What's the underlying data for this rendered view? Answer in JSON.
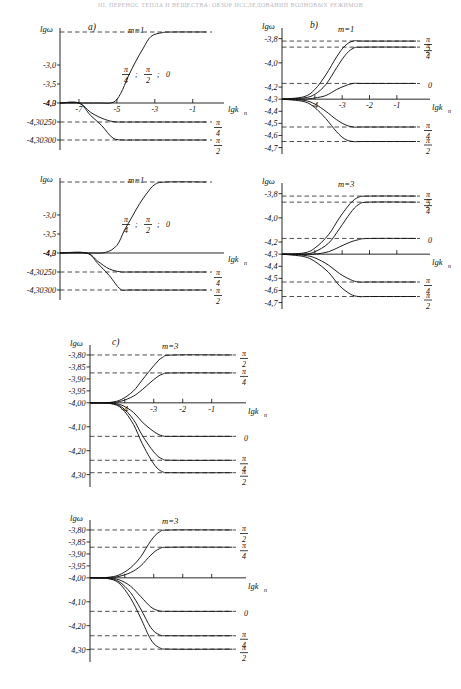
{
  "header": {
    "running_title": "III. ПЕРЕНОС ТЕПЛА И ВЕЩЕСТВА: ОБЗОР ИССЛЕДОВАНИЙ ВОЛНОВЫХ РЕЖИМОВ",
    "page_number": "2"
  },
  "axis_titles": {
    "y": "lgω",
    "x": "lgk",
    "x_sub": "n"
  },
  "symbols": {
    "pi": "π",
    "two": "2",
    "four": "4",
    "zero": "0",
    "semicolon": ";"
  },
  "panels": [
    {
      "id": "a-top",
      "label": "a)",
      "m_label": "m=1",
      "inline_annotation": [
        "π",
        "4",
        ";",
        "π",
        "2",
        ";",
        "0"
      ],
      "y_ticks": [
        "-3,0",
        "-3,5",
        "-4,0",
        "-4,3",
        "-4,30250",
        "-4,30300"
      ],
      "x_ticks": [
        "-7",
        "-5",
        "-3",
        "-1"
      ],
      "x_axis_label": "lgk",
      "x_axis_sub": "n",
      "right_labels": [
        {
          "num": "π",
          "den": "4"
        },
        {
          "num": "π",
          "den": "2"
        }
      ]
    },
    {
      "id": "a-bottom",
      "label": "",
      "m_label": "m=1",
      "inline_annotation": [
        "π",
        "4",
        ";",
        "π",
        "2",
        ";",
        "0"
      ],
      "y_ticks": [
        "-3,0",
        "-3,5",
        "-4,0",
        "-4,3",
        "-4,30250",
        "-4,30300"
      ],
      "x_ticks": [],
      "x_axis_label": "lgk",
      "x_axis_sub": "n",
      "right_labels": [
        {
          "num": "π",
          "den": "4"
        },
        {
          "num": "π",
          "den": "2"
        }
      ]
    },
    {
      "id": "b-top",
      "label": "b)",
      "m_label": "m=1",
      "y_ticks": [
        "-3,8",
        "-4,0",
        "-4,2",
        "-4,3",
        "-4,4",
        "-4,5",
        "-4,6",
        "-4,7"
      ],
      "x_ticks": [
        "-4",
        "-3",
        "-2",
        "-1"
      ],
      "x_axis_label": "lgk",
      "x_axis_sub": "n",
      "right_labels": [
        {
          "num": "π",
          "den": "2"
        },
        {
          "num": "π",
          "den": "4"
        },
        {
          "num": "0",
          "den": ""
        },
        {
          "num": "π",
          "den": "4"
        },
        {
          "num": "π",
          "den": "2"
        }
      ]
    },
    {
      "id": "b-bottom",
      "label": "",
      "m_label": "m=3",
      "y_ticks": [
        "-3,8",
        "-4,0",
        "-4,2",
        "-4,3",
        "-4,4",
        "-4,5",
        "-4,6",
        "-4,7"
      ],
      "x_ticks": [],
      "x_axis_label": "lgk",
      "x_axis_sub": "n",
      "right_labels": [
        {
          "num": "π",
          "den": "2"
        },
        {
          "num": "π",
          "den": "4"
        },
        {
          "num": "0",
          "den": ""
        },
        {
          "num": "π",
          "den": "4"
        },
        {
          "num": "π",
          "den": "2"
        }
      ]
    },
    {
      "id": "c-top",
      "label": "c)",
      "m_label": "m=3",
      "y_ticks": [
        "-3,80",
        "-3,85",
        "-3,90",
        "-3,95",
        "-4,00",
        "-4,10",
        "-4,20",
        "4,30"
      ],
      "x_ticks": [
        "-4",
        "-3",
        "-2",
        "-1"
      ],
      "x_axis_label": "lgk",
      "x_axis_sub": "n",
      "right_labels": [
        {
          "num": "π",
          "den": "2"
        },
        {
          "num": "π",
          "den": "4"
        },
        {
          "num": "0",
          "den": ""
        },
        {
          "num": "π",
          "den": "4"
        },
        {
          "num": "π",
          "den": "2"
        }
      ]
    },
    {
      "id": "c-bottom",
      "label": "",
      "m_label": "m=3",
      "y_ticks": [
        "-3,80",
        "-3,85",
        "-3,90",
        "-3,95",
        "-4,00",
        "-4,10",
        "-4,20",
        "4,30"
      ],
      "x_ticks": [],
      "x_axis_label": "lgk",
      "x_axis_sub": "n",
      "right_labels": [
        {
          "num": "π",
          "den": "2"
        },
        {
          "num": "π",
          "den": "4"
        },
        {
          "num": "0",
          "den": ""
        },
        {
          "num": "π",
          "den": "4"
        },
        {
          "num": "π",
          "den": "2"
        }
      ]
    }
  ],
  "chart_data": [
    {
      "id": "a-top",
      "type": "line",
      "title": "a)  m=1",
      "xlabel": "lgk_n",
      "ylabel": "lgω",
      "xlim": [
        -8.0,
        -0.3
      ],
      "xticks": [
        -7,
        -5,
        -3,
        -1
      ],
      "ylabel_ticks": [
        "-3,0",
        "-3,5",
        "-4,0",
        "-4,3",
        "-4,30250",
        "-4,30300"
      ],
      "grid": false,
      "notes": "Upper branch is a sigmoid rising from the -4,3 baseline to a plateau above -3,0; lower two branches break away at lgk_n = -7 and settle on -4,30250 and -4,30300.",
      "series": [
        {
          "name": "π/4 ; π/2 ; 0 (upper sigmoid)",
          "x": [
            -8.0,
            -7.0,
            -6.0,
            -5.2,
            -4.8,
            -4.4,
            -4.0,
            -3.6,
            -3.2,
            -2.6,
            -2.0,
            -0.3
          ],
          "y": [
            -4.3,
            -4.3,
            -4.3,
            -4.29,
            -4.15,
            -3.8,
            -3.4,
            -3.05,
            -2.85,
            -2.79,
            -2.78,
            -2.78
          ]
        },
        {
          "name": "π/4 (lower)",
          "x": [
            -8.0,
            -7.0,
            -6.4,
            -5.8,
            -5.2,
            -4.6,
            -4.0,
            -0.3
          ],
          "y": [
            -4.3,
            -4.3,
            -4.3012,
            -4.302,
            -4.30245,
            -4.3025,
            -4.3025,
            -4.3025
          ]
        },
        {
          "name": "π/2 (lower)",
          "x": [
            -8.0,
            -7.0,
            -6.4,
            -5.8,
            -5.2,
            -4.6,
            -4.0,
            -0.3
          ],
          "y": [
            -4.3,
            -4.3,
            -4.3016,
            -4.3026,
            -4.30295,
            -4.303,
            -4.303,
            -4.303
          ]
        }
      ],
      "hlines": [
        -2.78,
        -4.3025,
        -4.303
      ]
    },
    {
      "id": "a-bottom",
      "type": "line",
      "title": "m=1",
      "xlabel": "lgk_n",
      "ylabel": "lgω",
      "xlim": [
        -8.0,
        -0.3
      ],
      "xticks": [],
      "ylabel_ticks": [
        "-3,0",
        "-3,5",
        "-4,0",
        "-4,3",
        "-4,30250",
        "-4,30300"
      ],
      "grid": false,
      "notes": "Same family as a-top, shifted right: sigmoid onset near lgk_n = -5.",
      "series": [
        {
          "name": "π/4 ; π/2 ; 0 (upper sigmoid)",
          "x": [
            -8.0,
            -6.5,
            -5.6,
            -5.0,
            -4.6,
            -4.2,
            -3.8,
            -3.4,
            -3.0,
            -2.4,
            -0.3
          ],
          "y": [
            -4.3,
            -4.3,
            -4.29,
            -4.18,
            -3.9,
            -3.55,
            -3.2,
            -2.95,
            -2.82,
            -2.78,
            -2.78
          ]
        },
        {
          "name": "π/4 (lower)",
          "x": [
            -8.0,
            -6.6,
            -6.0,
            -5.4,
            -4.8,
            -4.2,
            -0.3
          ],
          "y": [
            -4.3,
            -4.3,
            -4.3011,
            -4.3021,
            -4.30248,
            -4.3025,
            -4.3025
          ]
        },
        {
          "name": "π/2 (lower)",
          "x": [
            -8.0,
            -6.6,
            -6.0,
            -5.4,
            -4.8,
            -4.2,
            -0.3
          ],
          "y": [
            -4.3,
            -4.3,
            -4.3014,
            -4.3026,
            -4.30298,
            -4.303,
            -4.303
          ]
        }
      ],
      "hlines": [
        -2.78,
        -4.3025,
        -4.303
      ]
    },
    {
      "id": "b-top",
      "type": "line",
      "title": "b)  m=1",
      "xlabel": "lgk_n",
      "ylabel": "lgω",
      "xlim": [
        -5.2,
        -0.3
      ],
      "xticks": [
        -4,
        -3,
        -2,
        -1
      ],
      "ylim": [
        -4.7,
        -3.75
      ],
      "ylabel_ticks": [
        "-3,8",
        "-4,0",
        "-4,2",
        "-4,3",
        "-4,4",
        "-4,5",
        "-4,6",
        "-4,7"
      ],
      "grid": false,
      "notes": "Five branches fan out from the common point lgω = -4,3. Upper plateaus: -3,82 (π/2), -3,87 (π/4), -4,17 (0). Lower plateaus: -4,53 (π/4), -4,65 (π/2).",
      "series": [
        {
          "name": "π/2 (up)",
          "x": [
            -5.2,
            -4.4,
            -4.0,
            -3.6,
            -3.2,
            -2.9,
            -2.6,
            -2.2,
            -0.3
          ],
          "y": [
            -4.3,
            -4.28,
            -4.22,
            -4.1,
            -3.95,
            -3.86,
            -3.82,
            -3.82,
            -3.82
          ]
        },
        {
          "name": "π/4 (up)",
          "x": [
            -5.2,
            -4.4,
            -4.0,
            -3.6,
            -3.2,
            -2.9,
            -2.6,
            -2.2,
            -0.3
          ],
          "y": [
            -4.3,
            -4.29,
            -4.26,
            -4.18,
            -4.04,
            -3.94,
            -3.88,
            -3.87,
            -3.87
          ]
        },
        {
          "name": "0",
          "x": [
            -5.2,
            -4.4,
            -4.0,
            -3.6,
            -3.2,
            -2.9,
            -2.6,
            -2.2,
            -0.3
          ],
          "y": [
            -4.3,
            -4.3,
            -4.29,
            -4.27,
            -4.22,
            -4.19,
            -4.17,
            -4.17,
            -4.17
          ]
        },
        {
          "name": "π/4 (down)",
          "x": [
            -5.2,
            -4.4,
            -4.0,
            -3.6,
            -3.2,
            -2.9,
            -2.6,
            -2.2,
            -0.3
          ],
          "y": [
            -4.3,
            -4.31,
            -4.34,
            -4.4,
            -4.47,
            -4.51,
            -4.53,
            -4.53,
            -4.53
          ]
        },
        {
          "name": "π/2 (down)",
          "x": [
            -5.2,
            -4.4,
            -4.0,
            -3.6,
            -3.2,
            -2.9,
            -2.6,
            -2.2,
            -0.3
          ],
          "y": [
            -4.3,
            -4.32,
            -4.37,
            -4.46,
            -4.57,
            -4.63,
            -4.65,
            -4.65,
            -4.65
          ]
        }
      ],
      "hlines": [
        -3.82,
        -3.87,
        -4.17,
        -4.53,
        -4.65
      ]
    },
    {
      "id": "b-bottom",
      "type": "line",
      "title": "m=3",
      "xlabel": "lgk_n",
      "ylabel": "lgω",
      "xlim": [
        -5.2,
        -0.3
      ],
      "xticks": [],
      "ylim": [
        -4.7,
        -3.75
      ],
      "ylabel_ticks": [
        "-3,8",
        "-4,0",
        "-4,2",
        "-4,3",
        "-4,4",
        "-4,5",
        "-4,6",
        "-4,7"
      ],
      "grid": false,
      "notes": "Same five-branch fan for m=3, transitions shifted slightly right relative to b-top.",
      "series": [
        {
          "name": "π/2 (up)",
          "x": [
            -5.2,
            -4.4,
            -4.0,
            -3.5,
            -3.1,
            -2.7,
            -2.4,
            -2.0,
            -0.3
          ],
          "y": [
            -4.3,
            -4.29,
            -4.25,
            -4.14,
            -4.0,
            -3.88,
            -3.83,
            -3.82,
            -3.82
          ]
        },
        {
          "name": "π/4 (up)",
          "x": [
            -5.2,
            -4.4,
            -4.0,
            -3.5,
            -3.1,
            -2.7,
            -2.4,
            -2.0,
            -0.3
          ],
          "y": [
            -4.3,
            -4.3,
            -4.28,
            -4.21,
            -4.09,
            -3.96,
            -3.89,
            -3.87,
            -3.87
          ]
        },
        {
          "name": "0",
          "x": [
            -5.2,
            -4.4,
            -4.0,
            -3.5,
            -3.1,
            -2.7,
            -2.4,
            -2.0,
            -0.3
          ],
          "y": [
            -4.3,
            -4.3,
            -4.3,
            -4.28,
            -4.24,
            -4.2,
            -4.18,
            -4.17,
            -4.17
          ]
        },
        {
          "name": "π/4 (down)",
          "x": [
            -5.2,
            -4.4,
            -4.0,
            -3.5,
            -3.1,
            -2.7,
            -2.4,
            -2.0,
            -0.3
          ],
          "y": [
            -4.3,
            -4.31,
            -4.33,
            -4.39,
            -4.46,
            -4.51,
            -4.53,
            -4.53,
            -4.53
          ]
        },
        {
          "name": "π/2 (down)",
          "x": [
            -5.2,
            -4.4,
            -4.0,
            -3.5,
            -3.1,
            -2.7,
            -2.4,
            -2.0,
            -0.3
          ],
          "y": [
            -4.3,
            -4.32,
            -4.36,
            -4.45,
            -4.56,
            -4.63,
            -4.65,
            -4.65,
            -4.65
          ]
        }
      ],
      "hlines": [
        -3.82,
        -3.87,
        -4.17,
        -4.53,
        -4.65
      ]
    },
    {
      "id": "c-top",
      "type": "line",
      "title": "c)  m=3",
      "xlabel": "lgk_n",
      "ylabel": "lgω",
      "xlim": [
        -5.2,
        -0.3
      ],
      "xticks": [
        -4,
        -3,
        -2,
        -1
      ],
      "ylabel_ticks": [
        "-3,80",
        "-3,85",
        "-3,90",
        "-3,95",
        "-4,00",
        "-4,10",
        "-4,20",
        "4,30"
      ],
      "grid": false,
      "notes": "Baseline at -4,00. Two rising branches plateau at -3,80 (π/2) and -3,875 (π/4); three falling branches plateau at -4,14 (0), -4,24 (π/4) and -4,29 (π/2).",
      "series": [
        {
          "name": "π/2 (up)",
          "x": [
            -5.2,
            -4.5,
            -4.1,
            -3.7,
            -3.4,
            -3.0,
            -2.7,
            -2.3,
            -0.3
          ],
          "y": [
            -4.0,
            -3.998,
            -3.985,
            -3.95,
            -3.905,
            -3.845,
            -3.81,
            -3.8,
            -3.8
          ]
        },
        {
          "name": "π/4 (up)",
          "x": [
            -5.2,
            -4.5,
            -4.1,
            -3.7,
            -3.4,
            -3.0,
            -2.7,
            -2.3,
            -0.3
          ],
          "y": [
            -4.0,
            -3.999,
            -3.992,
            -3.972,
            -3.945,
            -3.903,
            -3.88,
            -3.875,
            -3.875
          ]
        },
        {
          "name": "0",
          "x": [
            -5.2,
            -4.5,
            -4.1,
            -3.7,
            -3.4,
            -3.0,
            -2.7,
            -2.3,
            -0.3
          ],
          "y": [
            -4.0,
            -4.001,
            -4.01,
            -4.04,
            -4.08,
            -4.12,
            -4.138,
            -4.14,
            -4.14
          ]
        },
        {
          "name": "π/4 (down)",
          "x": [
            -5.2,
            -4.5,
            -4.1,
            -3.7,
            -3.4,
            -3.0,
            -2.7,
            -2.3,
            -0.3
          ],
          "y": [
            -4.0,
            -4.002,
            -4.018,
            -4.07,
            -4.135,
            -4.205,
            -4.235,
            -4.24,
            -4.24
          ]
        },
        {
          "name": "π/2 (down)",
          "x": [
            -5.2,
            -4.5,
            -4.1,
            -3.7,
            -3.4,
            -3.0,
            -2.7,
            -2.3,
            -0.3
          ],
          "y": [
            -4.0,
            -4.003,
            -4.024,
            -4.09,
            -4.17,
            -4.255,
            -4.288,
            -4.292,
            -4.292
          ]
        }
      ],
      "hlines": [
        -3.8,
        -3.875,
        -4.14,
        -4.24,
        -4.292
      ]
    },
    {
      "id": "c-bottom",
      "type": "line",
      "title": "m=3",
      "xlabel": "lgk_n",
      "ylabel": "lgω",
      "xlim": [
        -5.2,
        -0.3
      ],
      "xticks": [],
      "ylabel_ticks": [
        "-3,80",
        "-3,85",
        "-3,90",
        "-3,95",
        "-4,00",
        "-4,10",
        "-4,20",
        "4,30"
      ],
      "grid": false,
      "notes": "Same family as c-top; only two rising branches shown reaching -3,80 and -3,87 and three falling branches to -4,14, -4,24, -4,30.",
      "series": [
        {
          "name": "π/2 (up)",
          "x": [
            -5.2,
            -4.6,
            -4.2,
            -3.8,
            -3.45,
            -3.1,
            -2.8,
            -2.4,
            -0.3
          ],
          "y": [
            -4.0,
            -3.998,
            -3.988,
            -3.958,
            -3.912,
            -3.845,
            -3.808,
            -3.8,
            -3.8
          ]
        },
        {
          "name": "π/4 (up)",
          "x": [
            -5.2,
            -4.6,
            -4.2,
            -3.8,
            -3.45,
            -3.1,
            -2.8,
            -2.4,
            -0.3
          ],
          "y": [
            -4.0,
            -3.999,
            -3.994,
            -3.978,
            -3.95,
            -3.905,
            -3.878,
            -3.872,
            -3.872
          ]
        },
        {
          "name": "0",
          "x": [
            -5.2,
            -4.6,
            -4.2,
            -3.8,
            -3.45,
            -3.1,
            -2.8,
            -2.4,
            -0.3
          ],
          "y": [
            -4.0,
            -4.001,
            -4.008,
            -4.035,
            -4.078,
            -4.122,
            -4.138,
            -4.14,
            -4.14
          ]
        },
        {
          "name": "π/4 (down)",
          "x": [
            -5.2,
            -4.6,
            -4.2,
            -3.8,
            -3.45,
            -3.1,
            -2.8,
            -2.4,
            -0.3
          ],
          "y": [
            -4.0,
            -4.002,
            -4.016,
            -4.062,
            -4.13,
            -4.208,
            -4.238,
            -4.242,
            -4.242
          ]
        },
        {
          "name": "π/2 (down)",
          "x": [
            -5.2,
            -4.6,
            -4.2,
            -3.8,
            -3.45,
            -3.1,
            -2.8,
            -2.4,
            -0.3
          ],
          "y": [
            -4.0,
            -4.003,
            -4.022,
            -4.085,
            -4.168,
            -4.258,
            -4.292,
            -4.298,
            -4.298
          ]
        }
      ],
      "hlines": [
        -3.8,
        -3.872,
        -4.14,
        -4.242,
        -4.298
      ]
    }
  ]
}
